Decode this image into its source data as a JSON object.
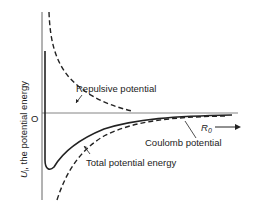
{
  "diagram": {
    "type": "potential-energy-vs-separation",
    "y_axis_label": "U, the potential energy",
    "y_axis_symbol": "U",
    "y_axis_subscript": "i",
    "y_axis_text": " the potential energy",
    "origin_label": "O",
    "x_axis_label": "R",
    "x_axis_subscript": "0",
    "curves": [
      {
        "name": "Repulsive potential",
        "style": "dashed",
        "label": "Repulsive potential"
      },
      {
        "name": "Coulomb potential",
        "style": "dashed",
        "label": "Coulomb potential"
      },
      {
        "name": "Total potential energy",
        "style": "solid",
        "label": "Total potential energy"
      }
    ],
    "colors": {
      "line": "#222222",
      "axis": "#555555",
      "background": "#ffffff"
    }
  }
}
